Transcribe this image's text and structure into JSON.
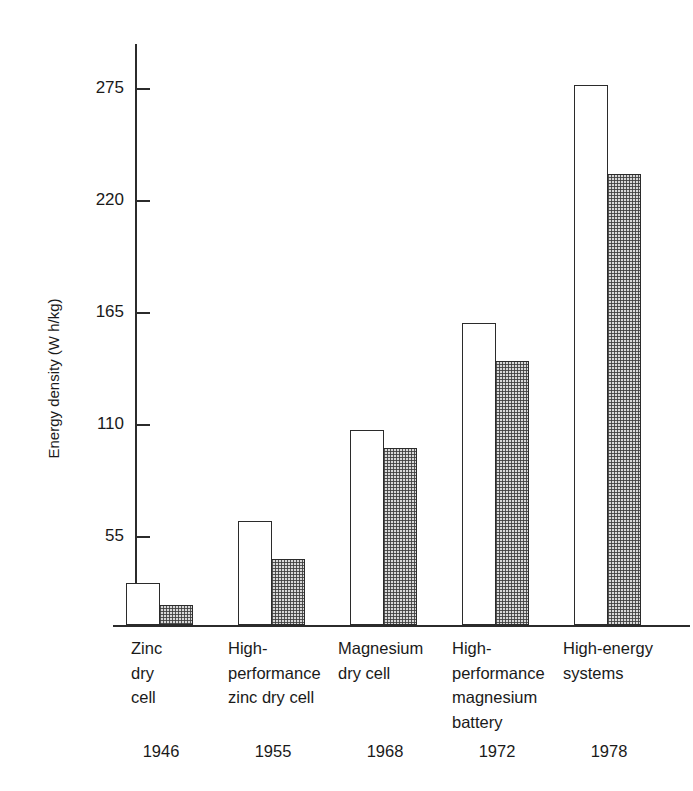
{
  "chart_data": {
    "type": "bar",
    "title": "",
    "subtitle": "",
    "xlabel": "",
    "ylabel": "Energy density (W h/kg)",
    "ylim": [
      0,
      300
    ],
    "yticks": [
      55,
      110,
      165,
      220,
      275
    ],
    "ytick_labels": [
      "55",
      "110",
      "165",
      "220",
      "275"
    ],
    "grid": false,
    "legend": "none",
    "categories": [
      "Zinc\ndry\ncell",
      "High-\nperformance\nzinc dry cell",
      "Magnesium\ndry cell",
      "High-\nperformance\nmagnesium\nbattery",
      "High-energy\nsystems"
    ],
    "secondary_axis_label": "",
    "secondary_categories": [
      "1946",
      "1955",
      "1968",
      "1972",
      "1978"
    ],
    "series": [
      {
        "name": "open",
        "fill": "white",
        "values": [
          21,
          51,
          96,
          153,
          275
        ]
      },
      {
        "name": "hatched",
        "fill": "stippled",
        "values": [
          11,
          32,
          87,
          134,
          221
        ]
      }
    ],
    "colors": {
      "axis": "#2b2b2b",
      "open_bar_fill": "#ffffff",
      "open_bar_stroke": "#2b2b2b",
      "hatched_bar_fill": "#d8d8d8",
      "hatched_bar_stroke": "#2b2b2b",
      "background": "#ffffff",
      "text": "#1a1a1a"
    }
  },
  "axis": {
    "y_title": "Energy density (W h/kg)",
    "ticks": [
      {
        "label": "275",
        "top": 88
      },
      {
        "label": "220",
        "top": 200
      },
      {
        "label": "165",
        "top": 312
      },
      {
        "label": "110",
        "top": 424
      },
      {
        "label": "55",
        "top": 536
      }
    ]
  },
  "groups": [
    {
      "category": "Zinc\ndry\ncell",
      "year": "1946",
      "left": 126,
      "label_left": 131,
      "year_left": 113,
      "open_height": 42,
      "hatched_height": 20
    },
    {
      "category": "High-\nperformance\nzinc dry cell",
      "year": "1955",
      "left": 238,
      "label_left": 228,
      "year_left": 225,
      "open_height": 104,
      "hatched_height": 66
    },
    {
      "category": "Magnesium\ndry cell",
      "year": "1968",
      "left": 350,
      "label_left": 338,
      "year_left": 337,
      "open_height": 195,
      "hatched_height": 177
    },
    {
      "category": "High-\nperformance\nmagnesium\nbattery",
      "year": "1972",
      "left": 462,
      "label_left": 452,
      "year_left": 449,
      "open_height": 302,
      "hatched_height": 264
    },
    {
      "category": "High-energy\nsystems",
      "year": "1978",
      "left": 574,
      "label_left": 563,
      "year_left": 561,
      "open_height": 540,
      "hatched_height": 451
    }
  ]
}
